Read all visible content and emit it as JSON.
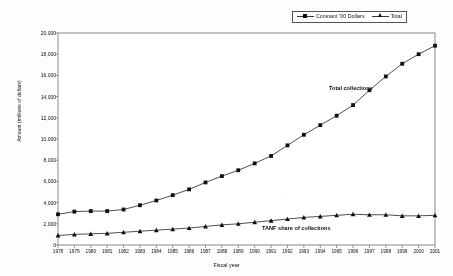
{
  "chart_data": {
    "type": "line",
    "title": "",
    "xlabel": "Fiscal year",
    "ylabel": "Amount (millions of dollars)",
    "x": [
      1978,
      1979,
      1980,
      1981,
      1982,
      1983,
      1984,
      1985,
      1986,
      1987,
      1988,
      1989,
      1990,
      1991,
      1992,
      1993,
      1994,
      1995,
      1996,
      1997,
      1998,
      1999,
      2000,
      2001
    ],
    "xtick_labels": [
      "1978",
      "1979",
      "1980",
      "1981",
      "1982",
      "1983",
      "1984",
      "1985",
      "1986",
      "1987",
      "1988",
      "1989",
      "1990",
      "1991",
      "1992",
      "1993",
      "1994",
      "1995",
      "1996",
      "1997",
      "1998",
      "1999",
      "2000",
      "2001"
    ],
    "ytick_labels": [
      "0",
      "2,000",
      "4,000",
      "6,000",
      "8,000",
      "10,000",
      "12,000",
      "14,000",
      "16,000",
      "18,000",
      "20,000"
    ],
    "ytick_values": [
      0,
      2000,
      4000,
      6000,
      8000,
      10000,
      12000,
      14000,
      16000,
      18000,
      20000
    ],
    "ylim": [
      0,
      20000
    ],
    "grid": false,
    "legend_position": "top-right",
    "series": [
      {
        "name": "Constant '00 Dollars",
        "marker": "square",
        "annotation": "Total collections",
        "values": [
          2900,
          3150,
          3200,
          3200,
          3350,
          3750,
          4200,
          4700,
          5250,
          5900,
          6500,
          7050,
          7700,
          8400,
          9400,
          10400,
          11300,
          12200,
          13200,
          14600,
          15900,
          17100,
          18000,
          18800
        ]
      },
      {
        "name": "Total",
        "marker": "triangle",
        "annotation": "TANF share of collections",
        "values": [
          900,
          1000,
          1050,
          1100,
          1200,
          1300,
          1400,
          1500,
          1600,
          1750,
          1900,
          2000,
          2150,
          2300,
          2450,
          2600,
          2700,
          2800,
          2900,
          2850,
          2850,
          2750,
          2750,
          2800
        ]
      }
    ],
    "annotations": [
      {
        "text": "Total collections",
        "x": 1998,
        "y": 16400
      },
      {
        "text": "TANF share of collections",
        "x": 1995,
        "y": 1900
      }
    ]
  },
  "legend": {
    "entries": [
      {
        "label": "Constant '00 Dollars",
        "marker": "square"
      },
      {
        "label": "Total",
        "marker": "triangle"
      }
    ]
  },
  "colors": {
    "line": "#3a3a3a",
    "marker": "#111111",
    "axis": "#555555",
    "background": "#fdfdfb"
  }
}
